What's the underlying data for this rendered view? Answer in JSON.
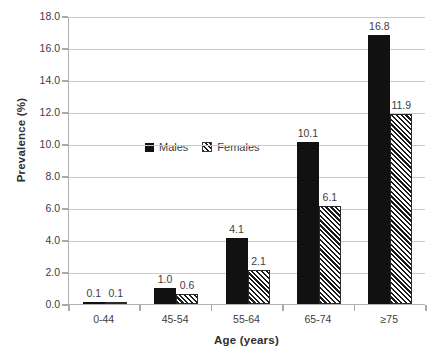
{
  "chart_data": {
    "type": "bar",
    "title": "",
    "xlabel": "Age (years)",
    "ylabel": "Prevalence (%)",
    "categories": [
      "0-44",
      "45-54",
      "55-64",
      "65-74",
      "≥75"
    ],
    "series": [
      {
        "name": "Males",
        "values": [
          0.1,
          1.0,
          4.1,
          10.1,
          16.8
        ],
        "color": "#111111",
        "fill": "solid"
      },
      {
        "name": "Females",
        "values": [
          0.1,
          0.6,
          2.1,
          6.1,
          11.9
        ],
        "color": "#111111",
        "fill": "diagonal-hatch"
      }
    ],
    "ylim": [
      0.0,
      18.0
    ],
    "ytick_step": 2.0,
    "yticks": [
      "0.0",
      "2.0",
      "4.0",
      "6.0",
      "8.0",
      "10.0",
      "12.0",
      "14.0",
      "16.0",
      "18.0"
    ],
    "grid": "horizontal",
    "legend_position": "inside-upper-left",
    "data_labels": [
      [
        "0.1",
        "0.1"
      ],
      [
        "1.0",
        "0.6"
      ],
      [
        "4.1",
        "2.1"
      ],
      [
        "10.1",
        "6.1"
      ],
      [
        "16.8",
        "11.9"
      ]
    ]
  },
  "legend": {
    "items": [
      {
        "label": "Males"
      },
      {
        "label": "Females"
      }
    ]
  },
  "axes": {
    "y_title": "Prevalence (%)",
    "x_title": "Age (years)"
  }
}
